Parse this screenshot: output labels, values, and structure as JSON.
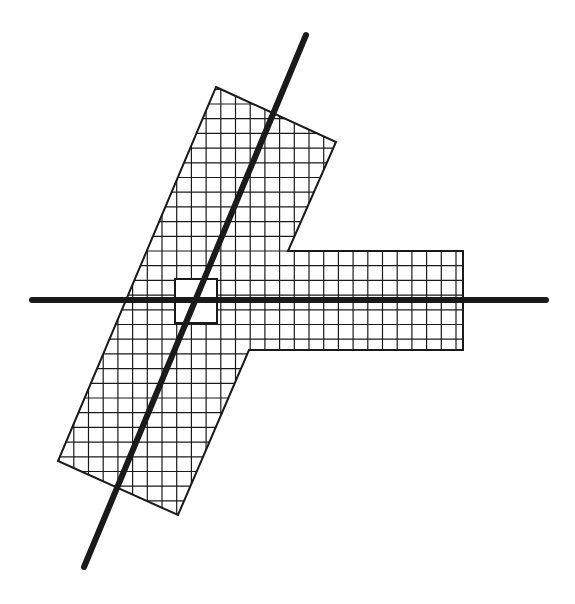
{
  "diagram": {
    "width": 575,
    "height": 604,
    "background": "#ffffff",
    "stroke_color": "#1a1a1a",
    "shape": {
      "description": "T-shaped cross-hatched region: a tilted bar joined to a horizontal arm",
      "outline": [
        [
          216,
          87
        ],
        [
          336,
          142
        ],
        [
          288,
          251
        ],
        [
          463,
          251
        ],
        [
          463,
          350
        ],
        [
          249,
          350
        ],
        [
          178,
          515
        ],
        [
          58,
          461
        ]
      ],
      "outline_width": 2,
      "grid": {
        "spacing": 14.7,
        "origin_x": 309,
        "origin_y": 251,
        "line_width": 1.2
      }
    },
    "horizontal_axis": {
      "x1": 32,
      "y1": 300,
      "x2": 546,
      "y2": 300,
      "width": 6
    },
    "diagonal_axis": {
      "x1": 306,
      "y1": 35,
      "x2": 84,
      "y2": 567,
      "width": 6
    },
    "marker_square": {
      "x": 175,
      "y": 279,
      "width": 42,
      "height": 44,
      "stroke_width": 2,
      "fill": "#ffffff"
    }
  }
}
